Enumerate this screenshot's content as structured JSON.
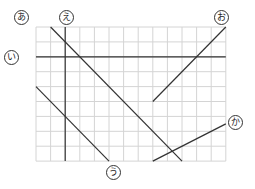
{
  "diagram": {
    "grid": {
      "cols": 13,
      "rows": 9,
      "origin_x": 36,
      "origin_y": 27,
      "cell_w": 14.6,
      "cell_h": 14.9,
      "grid_color": "#d4d4d4",
      "line_color": "#333333"
    },
    "lines": [
      {
        "id": "a",
        "label": "あ",
        "from": [
          1,
          0
        ],
        "to": [
          10,
          9
        ],
        "label_pos": [
          14,
          10
        ]
      },
      {
        "id": "i",
        "label": "い",
        "from": [
          0,
          2
        ],
        "to": [
          13,
          2
        ],
        "label_pos": [
          4,
          50
        ]
      },
      {
        "id": "u",
        "label": "う",
        "from": [
          0,
          4
        ],
        "to": [
          5,
          9
        ],
        "label_pos": [
          106,
          165
        ]
      },
      {
        "id": "e",
        "label": "え",
        "from": [
          2,
          0
        ],
        "to": [
          2,
          9
        ],
        "label_pos": [
          59,
          10
        ]
      },
      {
        "id": "o",
        "label": "お",
        "from": [
          8,
          5
        ],
        "to": [
          13,
          0
        ],
        "label_pos": [
          214,
          10
        ]
      },
      {
        "id": "ka",
        "label": "か",
        "from": [
          8,
          9
        ],
        "to": [
          13,
          6.5
        ],
        "label_pos": [
          228,
          115
        ]
      }
    ]
  }
}
